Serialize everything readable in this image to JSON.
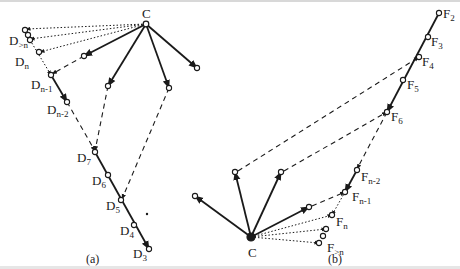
{
  "figure": {
    "colors": {
      "ink": "#1a1a1a",
      "background": "#ffffff"
    },
    "panels": [
      {
        "id": "a",
        "caption": "(a)",
        "caption_pos": [
          86,
          263
        ],
        "center": {
          "label": "C",
          "pos": [
            146,
            24
          ],
          "label_pos": [
            142,
            18
          ]
        },
        "nodes": [
          {
            "id": "Dgtn_a",
            "pos": [
              25,
              30
            ]
          },
          {
            "id": "Dgtn_b",
            "pos": [
              28,
              35
            ]
          },
          {
            "id": "Dgtn_c",
            "pos": [
              30,
              40
            ]
          },
          {
            "id": "Dn",
            "pos": [
              39,
              52
            ]
          },
          {
            "id": "Dn-1",
            "pos": [
              51,
              75
            ]
          },
          {
            "id": "Dn-2",
            "pos": [
              67,
              102
            ]
          },
          {
            "id": "D7",
            "pos": [
              95,
              152
            ]
          },
          {
            "id": "D6",
            "pos": [
              108,
              175
            ]
          },
          {
            "id": "D5",
            "pos": [
              121,
              200
            ]
          },
          {
            "id": "D4",
            "pos": [
              134,
              225
            ]
          },
          {
            "id": "D3",
            "pos": [
              149,
              249
            ]
          },
          {
            "id": "s1",
            "pos": [
              84,
              56
            ]
          },
          {
            "id": "s2",
            "pos": [
              108,
              86
            ]
          },
          {
            "id": "s3",
            "pos": [
              169,
              88
            ]
          },
          {
            "id": "s4",
            "pos": [
              197,
              68
            ]
          }
        ],
        "labels": [
          {
            "text": "D",
            "sub": ">n",
            "pos": [
              9,
              45
            ]
          },
          {
            "text": "D",
            "sub": "n",
            "pos": [
              15,
              66
            ]
          },
          {
            "text": "D",
            "sub": "n-1",
            "pos": [
              31,
              89
            ]
          },
          {
            "text": "D",
            "sub": "n-2",
            "pos": [
              47,
              114
            ]
          },
          {
            "text": "D",
            "sub": "7",
            "pos": [
              77,
              162
            ]
          },
          {
            "text": "D",
            "sub": "6",
            "pos": [
              92,
              185
            ]
          },
          {
            "text": "D",
            "sub": "5",
            "pos": [
              106,
              210
            ]
          },
          {
            "text": "D",
            "sub": "4",
            "pos": [
              120,
              235
            ]
          },
          {
            "text": "D",
            "sub": "3",
            "pos": [
              133,
              258
            ]
          }
        ],
        "solid": [
          [
            [
              146,
              24
            ],
            [
              84,
              56
            ]
          ],
          [
            [
              146,
              24
            ],
            [
              108,
              86
            ]
          ],
          [
            [
              146,
              24
            ],
            [
              169,
              88
            ]
          ],
          [
            [
              146,
              24
            ],
            [
              197,
              68
            ]
          ],
          [
            [
              51,
              75
            ],
            [
              67,
              102
            ]
          ],
          [
            [
              95,
              152
            ],
            [
              149,
              249
            ]
          ]
        ],
        "dashed": [
          [
            [
              84,
              56
            ],
            [
              52,
              74
            ]
          ],
          [
            [
              108,
              86
            ],
            [
              95,
              151
            ]
          ],
          [
            [
              169,
              88
            ],
            [
              122,
              199
            ]
          ],
          [
            [
              67,
              102
            ],
            [
              95,
              151
            ]
          ]
        ],
        "dotted": [
          [
            [
              146,
              24
            ],
            [
              26,
              29
            ]
          ],
          [
            [
              146,
              24
            ],
            [
              30,
              39
            ]
          ],
          [
            [
              146,
              24
            ],
            [
              40,
              52
            ]
          ],
          [
            [
              30,
              40
            ],
            [
              51,
              75
            ]
          ]
        ],
        "dot": [
          147,
          214
        ]
      },
      {
        "id": "b",
        "caption": "(b)",
        "caption_pos": [
          328,
          263
        ],
        "center": {
          "label": "C",
          "pos": [
            251,
            237
          ],
          "label_pos": [
            248,
            257
          ]
        },
        "nodes": [
          {
            "id": "F2",
            "pos": [
              439,
              13
            ]
          },
          {
            "id": "F3",
            "pos": [
              428,
              37
            ]
          },
          {
            "id": "F4",
            "pos": [
              419,
              57
            ]
          },
          {
            "id": "F5",
            "pos": [
              403,
              80
            ]
          },
          {
            "id": "F6",
            "pos": [
              387,
              112
            ]
          },
          {
            "id": "Fn-2",
            "pos": [
              357,
              170
            ]
          },
          {
            "id": "Fn-1",
            "pos": [
              345,
              192
            ]
          },
          {
            "id": "Fn",
            "pos": [
              332,
              215
            ]
          },
          {
            "id": "Fgtn_a",
            "pos": [
              326,
              229
            ]
          },
          {
            "id": "Fgtn_b",
            "pos": [
              323,
              236
            ]
          },
          {
            "id": "Fgtn_c",
            "pos": [
              319,
              243
            ]
          },
          {
            "id": "t1",
            "pos": [
              195,
              196
            ]
          },
          {
            "id": "t2",
            "pos": [
              235,
              172
            ]
          },
          {
            "id": "t3",
            "pos": [
              281,
              172
            ]
          },
          {
            "id": "t4",
            "pos": [
              309,
              207
            ]
          }
        ],
        "labels": [
          {
            "text": "F",
            "sub": "2",
            "pos": [
              443,
              18
            ]
          },
          {
            "text": "F",
            "sub": "3",
            "pos": [
              431,
              46
            ]
          },
          {
            "text": "F",
            "sub": "4",
            "pos": [
              422,
              66
            ]
          },
          {
            "text": "F",
            "sub": "5",
            "pos": [
              407,
              89
            ]
          },
          {
            "text": "F",
            "sub": "6",
            "pos": [
              391,
              121
            ]
          },
          {
            "text": "F",
            "sub": "n-2",
            "pos": [
              361,
              181
            ]
          },
          {
            "text": "F",
            "sub": "n-1",
            "pos": [
              352,
              201
            ]
          },
          {
            "text": "F",
            "sub": "n",
            "pos": [
              336,
              226
            ]
          },
          {
            "text": "F",
            "sub": ">n",
            "pos": [
              327,
              252
            ]
          }
        ],
        "solid": [
          [
            [
              251,
              237
            ],
            [
              195,
              196
            ]
          ],
          [
            [
              251,
              237
            ],
            [
              235,
              172
            ]
          ],
          [
            [
              251,
              237
            ],
            [
              281,
              172
            ]
          ],
          [
            [
              251,
              237
            ],
            [
              309,
              207
            ]
          ],
          [
            [
              439,
              13
            ],
            [
              387,
              112
            ]
          ],
          [
            [
              357,
              170
            ],
            [
              345,
              192
            ]
          ]
        ],
        "dashed": [
          [
            [
              238,
              171
            ],
            [
              419,
              57
            ]
          ],
          [
            [
              284,
              171
            ],
            [
              387,
              112
            ]
          ],
          [
            [
              387,
              112
            ],
            [
              357,
              169
            ]
          ],
          [
            [
              312,
              206
            ],
            [
              345,
              192
            ]
          ]
        ],
        "dotted": [
          [
            [
              251,
              237
            ],
            [
              332,
              215
            ]
          ],
          [
            [
              251,
              237
            ],
            [
              326,
              229
            ]
          ],
          [
            [
              251,
              237
            ],
            [
              319,
              243
            ]
          ],
          [
            [
              345,
              192
            ],
            [
              332,
              215
            ]
          ]
        ]
      }
    ]
  }
}
